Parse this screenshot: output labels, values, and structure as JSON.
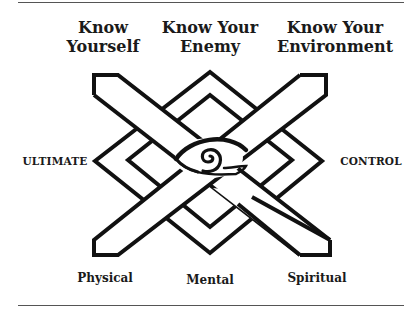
{
  "header": {
    "col1": {
      "line1": "Know",
      "line2": "Yourself"
    },
    "col2": {
      "line1": "Know Your",
      "line2": "Enemy"
    },
    "col3": {
      "line1": "Know Your",
      "line2": "Environment"
    }
  },
  "sides": {
    "left": "ULTIMATE",
    "right": "CONTROL"
  },
  "footer": {
    "col1": "Physical",
    "col2": "Mental",
    "col3": "Spiritual"
  },
  "symbol": {
    "name": "interlaced-knot-with-eye",
    "center_icon": "eye-icon"
  },
  "colors": {
    "ink": "#111111",
    "background": "#ffffff",
    "rule": "#555555"
  }
}
